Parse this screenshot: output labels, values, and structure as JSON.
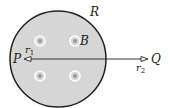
{
  "diagram": {
    "region": {
      "label": "R",
      "fill": "#d6d6d6",
      "stroke": "#222222",
      "cx": 58,
      "cy": 59,
      "r": 48
    },
    "field": {
      "label": "B",
      "symbol": "out-of-page dots",
      "points": [
        [
          40,
          41
        ],
        [
          75,
          41
        ],
        [
          40,
          76
        ],
        [
          75,
          76
        ]
      ]
    },
    "point_inside": {
      "label": "P",
      "radius_label": "r",
      "radius_sub": "1"
    },
    "point_outside": {
      "label": "Q",
      "radius_label": "r",
      "radius_sub": "2"
    }
  }
}
